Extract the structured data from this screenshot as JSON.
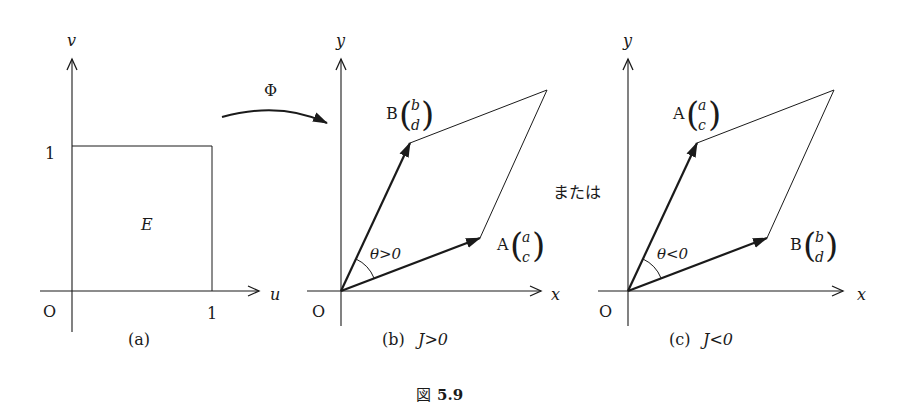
{
  "figure": {
    "caption_prefix": "図",
    "caption_number": "5.9",
    "map_label": "Φ",
    "or_label": "または",
    "colors": {
      "ink": "#1a1a1a",
      "background": "#ffffff"
    }
  },
  "panel_a": {
    "caption": "(a)",
    "x_axis_label": "u",
    "y_axis_label": "v",
    "origin_label": "O",
    "x_tick": "1",
    "y_tick": "1",
    "region_label": "E"
  },
  "panel_b": {
    "caption_prefix": "(b)",
    "caption_condition": "J>0",
    "x_axis_label": "x",
    "y_axis_label": "y",
    "origin_label": "O",
    "angle_label": "θ>0",
    "upper_point": {
      "name": "B",
      "top": "b",
      "bottom": "d"
    },
    "lower_point": {
      "name": "A",
      "top": "a",
      "bottom": "c"
    }
  },
  "panel_c": {
    "caption_prefix": "(c)",
    "caption_condition": "J<0",
    "x_axis_label": "x",
    "y_axis_label": "y",
    "origin_label": "O",
    "angle_label": "θ<0",
    "upper_point": {
      "name": "A",
      "top": "a",
      "bottom": "c"
    },
    "lower_point": {
      "name": "B",
      "top": "b",
      "bottom": "d"
    }
  }
}
